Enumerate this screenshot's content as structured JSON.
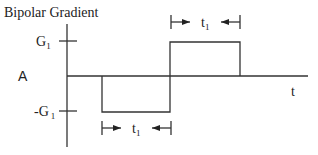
{
  "title": "Bipolar Gradient",
  "y_axis_label": "A",
  "x_axis_label": "t",
  "levels": {
    "positive": {
      "main": "G",
      "sub": "1"
    },
    "negative": {
      "main": "-G",
      "sub": "1"
    }
  },
  "duration_top": {
    "main": "t",
    "sub": "1"
  },
  "duration_bottom": {
    "main": "t",
    "sub": "1"
  },
  "waveform": [
    {
      "lobe": "negative",
      "amplitude": "-G1",
      "duration": "t1"
    },
    {
      "lobe": "positive",
      "amplitude": "G1",
      "duration": "t1"
    }
  ]
}
